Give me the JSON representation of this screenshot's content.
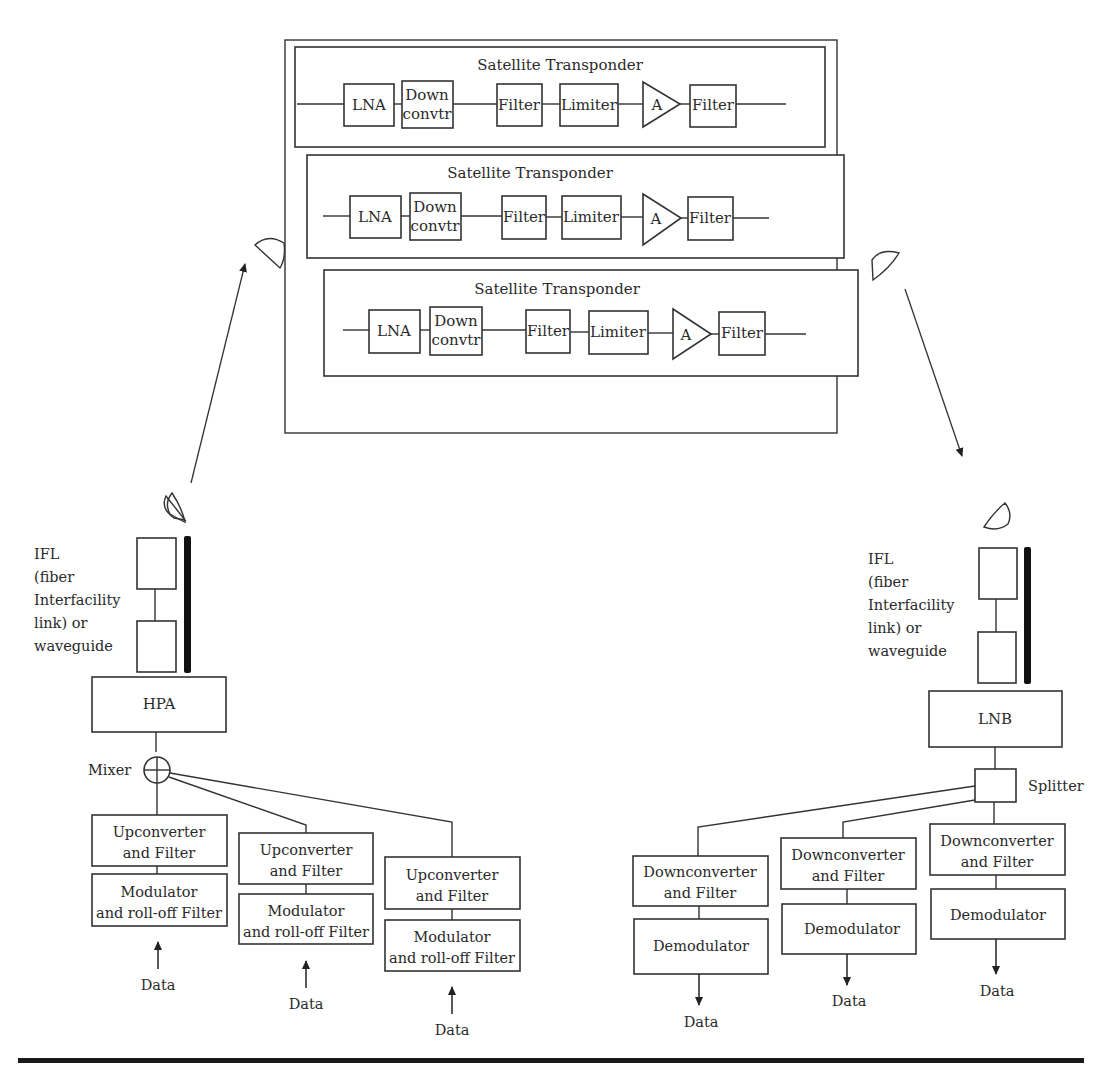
{
  "diagram": {
    "satellite": {
      "transponders": [
        {
          "title": "Satellite Transponder",
          "blocks": {
            "lna": "LNA",
            "down1": "Down",
            "down2": "convtr",
            "filter1": "Filter",
            "limiter": "Limiter",
            "amp": "A",
            "filter2": "Filter"
          }
        },
        {
          "title": "Satellite Transponder",
          "blocks": {
            "lna": "LNA",
            "down1": "Down",
            "down2": "convtr",
            "filter1": "Filter",
            "limiter": "Limiter",
            "amp": "A",
            "filter2": "Filter"
          }
        },
        {
          "title": "Satellite Transponder",
          "blocks": {
            "lna": "LNA",
            "down1": "Down",
            "down2": "convtr",
            "filter1": "Filter",
            "limiter": "Limiter",
            "amp": "A",
            "filter2": "Filter"
          }
        }
      ]
    },
    "uplink": {
      "ifl_lines": [
        "IFL",
        "(fiber",
        "Interfacility",
        "link) or",
        "waveguide"
      ],
      "hpa": "HPA",
      "mixer": "Mixer",
      "chains": [
        {
          "up1": "Upconverter",
          "up2": "and Filter",
          "mod1": "Modulator",
          "mod2": "and roll-off Filter",
          "data": "Data"
        },
        {
          "up1": "Upconverter",
          "up2": "and Filter",
          "mod1": "Modulator",
          "mod2": "and roll-off Filter",
          "data": "Data"
        },
        {
          "up1": "Upconverter",
          "up2": "and Filter",
          "mod1": "Modulator",
          "mod2": "and roll-off Filter",
          "data": "Data"
        }
      ]
    },
    "downlink": {
      "ifl_lines": [
        "IFL",
        "(fiber",
        "Interfacility",
        "link) or",
        "waveguide"
      ],
      "lnb": "LNB",
      "splitter": "Splitter",
      "chains": [
        {
          "down1": "Downconverter",
          "down2": "and Filter",
          "demod": "Demodulator",
          "data": "Data"
        },
        {
          "down1": "Downconverter",
          "down2": "and Filter",
          "demod": "Demodulator",
          "data": "Data"
        },
        {
          "down1": "Downconverter",
          "down2": "and Filter",
          "demod": "Demodulator",
          "data": "Data"
        }
      ]
    }
  }
}
